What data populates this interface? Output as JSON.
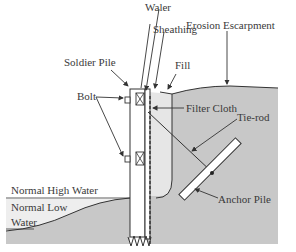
{
  "diagram": {
    "type": "cross-section",
    "labels": {
      "waler": "Waler",
      "erosion_escarpment": "Erosion Escarpment",
      "soldier_pile": "Soldier Pile",
      "sheathing": "Sheathing",
      "fill": "Fill",
      "bolt": "Bolt",
      "filter_cloth": "Filter Cloth",
      "tie_rod": "Tie-rod",
      "normal_high_water": "Normal High Water",
      "normal_low_water_line1": "Normal Low",
      "normal_low_water_line2": "Water",
      "anchor_pile": "Anchor Pile"
    },
    "colors": {
      "soil": "#c8c8c8",
      "fill": "#e6e6e6",
      "water": "#eeeeee",
      "line": "#333333",
      "background": "#ffffff"
    }
  }
}
